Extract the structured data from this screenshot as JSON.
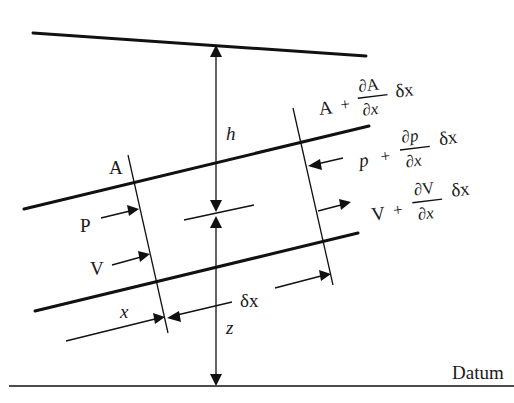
{
  "figure": {
    "colors": {
      "ink": "#111111",
      "background": "#ffffff"
    }
  },
  "labels": {
    "head": "h",
    "elevation": "z",
    "datum": "Datum",
    "inlet_area": "A",
    "inlet_pressure": "P",
    "inlet_velocity": "V",
    "position": "x",
    "element_length": "δx",
    "outlet_area": {
      "base": "A",
      "op": "+",
      "numerator": "∂A",
      "denominator": "∂x",
      "suffix": "δx"
    },
    "outlet_pressure": {
      "base": "p",
      "op": "+",
      "numerator": "∂p",
      "denominator": "∂x",
      "suffix": "δx"
    },
    "outlet_velocity": {
      "base": "V",
      "op": "+",
      "numerator": "∂V",
      "denominator": "∂x",
      "suffix": "δx"
    }
  },
  "geometry": {
    "energy_line": [
      [
        33,
        33
      ],
      [
        366,
        56
      ]
    ],
    "upper_boundary": [
      [
        24,
        209
      ],
      [
        369,
        126
      ]
    ],
    "lower_boundary": [
      [
        35,
        311
      ],
      [
        358,
        233
      ]
    ],
    "centerline": [
      [
        184,
        220
      ],
      [
        254,
        205
      ]
    ],
    "datum_line": [
      [
        9,
        386
      ],
      [
        514,
        386
      ]
    ],
    "left_section": [
      [
        128,
        155
      ],
      [
        168,
        333
      ]
    ],
    "right_section": [
      [
        293,
        108
      ],
      [
        333,
        285
      ]
    ],
    "vertical_ref_x": 216
  }
}
